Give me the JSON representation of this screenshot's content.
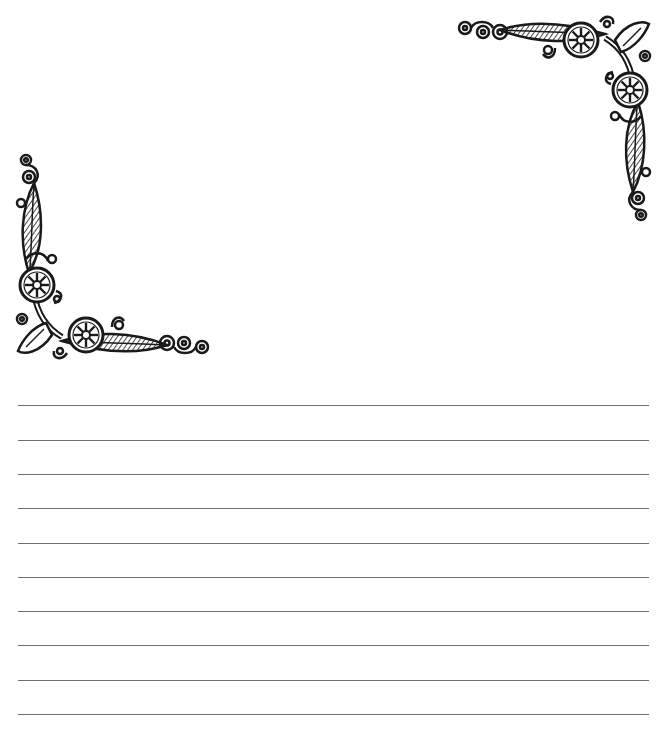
{
  "page": {
    "type": "lined-stationery",
    "background": "#ffffff",
    "ornaments": [
      {
        "name": "top-right-corner-ornament",
        "position": "top-right",
        "color": "#1a1a1a"
      },
      {
        "name": "bottom-left-corner-ornament",
        "position": "left",
        "color": "#1a1a1a"
      }
    ],
    "lines": {
      "count": 10,
      "color": "#6e6e6e",
      "positions_y": [
        405,
        440,
        474,
        508,
        543,
        577,
        611,
        645,
        680,
        714
      ]
    }
  }
}
